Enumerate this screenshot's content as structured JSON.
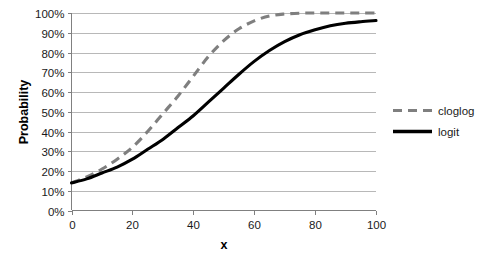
{
  "chart_data": {
    "type": "line",
    "title": "",
    "xlabel": "x",
    "ylabel": "Probability",
    "xlim": [
      0,
      100
    ],
    "ylim": [
      0,
      1
    ],
    "grid": true,
    "legend_position": "right",
    "x_tick_labels": [
      "0",
      "20",
      "40",
      "60",
      "80",
      "100"
    ],
    "x_ticks": [
      0,
      20,
      40,
      60,
      80,
      100
    ],
    "y_tick_labels": [
      "0%",
      "10%",
      "20%",
      "30%",
      "40%",
      "50%",
      "60%",
      "70%",
      "80%",
      "90%",
      "100%"
    ],
    "y_ticks": [
      0,
      0.1,
      0.2,
      0.3,
      0.4,
      0.5,
      0.6,
      0.7,
      0.8,
      0.9,
      1.0
    ],
    "x": [
      0,
      5,
      10,
      15,
      20,
      25,
      30,
      35,
      40,
      45,
      50,
      55,
      60,
      65,
      70,
      75,
      80,
      85,
      90,
      95,
      100
    ],
    "series": [
      {
        "name": "cloglog",
        "color": "#7f7f7f",
        "style": "dashed",
        "values": [
          0.14,
          0.17,
          0.21,
          0.26,
          0.32,
          0.4,
          0.49,
          0.58,
          0.68,
          0.78,
          0.86,
          0.92,
          0.96,
          0.985,
          0.995,
          0.999,
          1.0,
          1.0,
          1.0,
          1.0,
          1.0
        ]
      },
      {
        "name": "logit",
        "color": "#000000",
        "style": "solid",
        "values": [
          0.14,
          0.16,
          0.19,
          0.22,
          0.26,
          0.31,
          0.36,
          0.42,
          0.48,
          0.55,
          0.62,
          0.69,
          0.755,
          0.81,
          0.855,
          0.89,
          0.915,
          0.935,
          0.948,
          0.956,
          0.962
        ]
      }
    ]
  },
  "legend": {
    "items": [
      {
        "label": "cloglog"
      },
      {
        "label": "logit"
      }
    ]
  },
  "colors": {
    "cloglog": "#7f7f7f",
    "logit": "#000000",
    "gridline": "#a6a6a6",
    "axis": "#808080",
    "text": "#1a1a1a",
    "background": "#ffffff"
  }
}
